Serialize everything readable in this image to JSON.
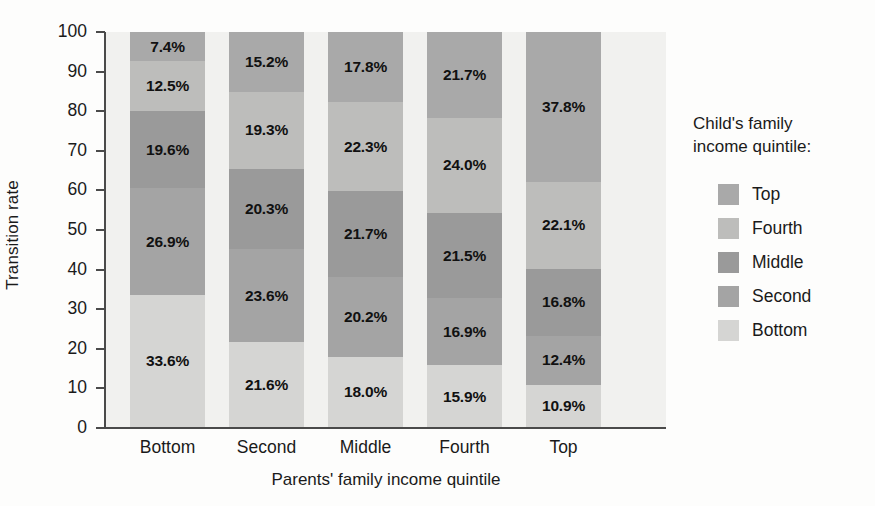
{
  "chart_data": {
    "type": "bar",
    "subtype": "stacked-bar-100",
    "title": "",
    "xlabel": "Parents' family income quintile",
    "ylabel": "Transition rate",
    "ylim": [
      0,
      100
    ],
    "yticks": [
      0,
      10,
      20,
      30,
      40,
      50,
      60,
      70,
      80,
      90,
      100
    ],
    "grid": false,
    "legend_position": "right",
    "legend_title": "Child's family\nincome quintile:",
    "categories": [
      "Bottom",
      "Second",
      "Middle",
      "Fourth",
      "Top"
    ],
    "series": [
      {
        "name": "Top",
        "color": "#a9a9a9",
        "values": [
          7.4,
          15.2,
          17.8,
          21.7,
          37.8
        ],
        "labels": [
          "7.4%",
          "15.2%",
          "17.8%",
          "21.7%",
          "37.8%"
        ]
      },
      {
        "name": "Fourth",
        "color": "#bdbdbb",
        "values": [
          12.5,
          19.3,
          22.3,
          24.0,
          22.1
        ],
        "labels": [
          "12.5%",
          "19.3%",
          "22.3%",
          "24.0%",
          "22.1%"
        ]
      },
      {
        "name": "Middle",
        "color": "#9a9a9a",
        "values": [
          19.6,
          20.3,
          21.7,
          21.5,
          16.8
        ],
        "labels": [
          "19.6%",
          "20.3%",
          "21.7%",
          "21.5%",
          "16.8%"
        ]
      },
      {
        "name": "Second",
        "color": "#a4a4a4",
        "values": [
          26.9,
          23.6,
          20.2,
          16.9,
          12.4
        ],
        "labels": [
          "26.9%",
          "23.6%",
          "20.2%",
          "16.9%",
          "12.4%"
        ]
      },
      {
        "name": "Bottom",
        "color": "#d5d5d3",
        "values": [
          33.6,
          21.6,
          18.0,
          15.9,
          10.9
        ],
        "labels": [
          "33.6%",
          "21.6%",
          "18.0%",
          "15.9%",
          "10.9%"
        ]
      }
    ],
    "legend_entries": [
      {
        "label": "Top",
        "color": "#a9a9a9"
      },
      {
        "label": "Fourth",
        "color": "#bdbdbb"
      },
      {
        "label": "Middle",
        "color": "#9a9a9a"
      },
      {
        "label": "Second",
        "color": "#a4a4a4"
      },
      {
        "label": "Bottom",
        "color": "#d5d5d3"
      }
    ],
    "plot_background": "#f1f1ef",
    "axis_color": "#4a4a4a",
    "label_text_color": "#111111"
  }
}
